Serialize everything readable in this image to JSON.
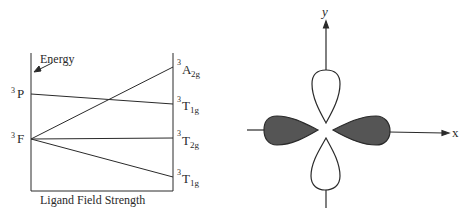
{
  "energy_diagram": {
    "axis_label_energy": "Energy",
    "axis_label_x": "Ligand Field Strength",
    "left_terms": [
      {
        "sup": "3",
        "term": "P"
      },
      {
        "sup": "3",
        "term": "F"
      }
    ],
    "right_terms": [
      {
        "sup": "3",
        "term": "A",
        "sub": "2g"
      },
      {
        "sup": "3",
        "term": "T",
        "sub": "1g"
      },
      {
        "sup": "3",
        "term": "T",
        "sub": "2g"
      },
      {
        "sup": "3",
        "term": "T",
        "sub": "1g"
      }
    ]
  },
  "orbital_diagram": {
    "x_label": "x",
    "y_label": "y"
  },
  "colors": {
    "line": "#2a2a2a",
    "shaded_lobe": "#555555"
  }
}
